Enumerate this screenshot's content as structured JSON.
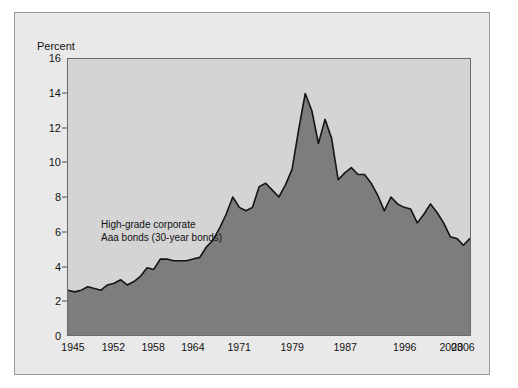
{
  "figure": {
    "percent_label": "Percent",
    "annotation_line1": "High-grade corporate",
    "annotation_line2": "Aaa bonds (30-year bonds)",
    "colors": {
      "page_background": "#ffffff",
      "figure_background": "#e9e9e9",
      "figure_border": "#9a9a9a",
      "plot_background": "#d4d4d4",
      "plot_border": "#6b6b6b",
      "area_fill": "#7d7d7d",
      "series_line": "#141414",
      "text": "#111111",
      "tick_mark": "#4a4a4a"
    }
  },
  "chart_data": {
    "type": "area",
    "title": "",
    "subtitle": "",
    "xlabel": "",
    "ylabel": "Percent",
    "ylim": [
      0,
      16
    ],
    "xlim": [
      1945,
      2006
    ],
    "grid": false,
    "legend_position": "none",
    "annotations": [
      {
        "text": "High-grade corporate Aaa bonds (30-year bonds)",
        "x": 1952,
        "y": 6.6
      }
    ],
    "ytick_labels": [
      "0",
      "2",
      "4",
      "6",
      "8",
      "10",
      "12",
      "14",
      "16"
    ],
    "ytick_values": [
      0,
      2,
      4,
      6,
      8,
      10,
      12,
      14,
      16
    ],
    "xtick_labels": [
      "1945",
      "1952",
      "1958",
      "1964",
      "1971",
      "1979",
      "1987",
      "1996",
      "2003",
      "2006"
    ],
    "xtick_values": [
      1945,
      1952,
      1958,
      1964,
      1971,
      1979,
      1987,
      1996,
      2003,
      2006
    ],
    "series": [
      {
        "name": "High-grade corporate Aaa bonds (30-year bonds)",
        "x": [
          1945,
          1946,
          1947,
          1948,
          1949,
          1950,
          1951,
          1952,
          1953,
          1954,
          1955,
          1956,
          1957,
          1958,
          1959,
          1960,
          1961,
          1962,
          1963,
          1964,
          1965,
          1966,
          1967,
          1968,
          1969,
          1970,
          1971,
          1972,
          1973,
          1974,
          1975,
          1976,
          1977,
          1978,
          1979,
          1980,
          1981,
          1982,
          1983,
          1984,
          1985,
          1986,
          1987,
          1988,
          1989,
          1990,
          1991,
          1992,
          1993,
          1994,
          1995,
          1996,
          1997,
          1998,
          1999,
          2000,
          2001,
          2002,
          2003,
          2004,
          2005,
          2006
        ],
        "values": [
          2.6,
          2.5,
          2.6,
          2.8,
          2.7,
          2.6,
          2.9,
          3.0,
          3.2,
          2.9,
          3.1,
          3.4,
          3.9,
          3.8,
          4.4,
          4.4,
          4.3,
          4.3,
          4.3,
          4.4,
          4.5,
          5.1,
          5.5,
          6.2,
          7.0,
          8.0,
          7.4,
          7.2,
          7.4,
          8.6,
          8.8,
          8.4,
          8.0,
          8.7,
          9.6,
          11.9,
          14.0,
          13.0,
          11.1,
          12.5,
          11.4,
          9.0,
          9.4,
          9.7,
          9.3,
          9.3,
          8.8,
          8.1,
          7.2,
          8.0,
          7.6,
          7.4,
          7.3,
          6.5,
          7.0,
          7.6,
          7.1,
          6.5,
          5.7,
          5.6,
          5.2,
          5.6
        ],
        "peak_value": 14.0,
        "peak_year": 1981,
        "start_value": 2.6,
        "end_value": 6.4
      }
    ]
  }
}
